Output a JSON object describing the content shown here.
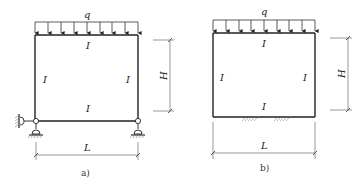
{
  "figures": [
    {
      "id": "a",
      "caption": "a)",
      "load_label": "q",
      "top_beam_label": "I",
      "left_column_label": "I",
      "right_column_label": "I",
      "bottom_beam_label": "I",
      "height_label": "H",
      "length_label": "L",
      "supports": "left lateral roller + two vertical roller supports at bottom corners"
    },
    {
      "id": "b",
      "caption": "b)",
      "load_label": "q",
      "top_beam_label": "I",
      "left_column_label": "I",
      "right_column_label": "I",
      "bottom_beam_label": "I",
      "height_label": "H",
      "length_label": "L",
      "supports": "bottom beam resting on ground (hatched)"
    }
  ],
  "colors": {
    "line": "#222222",
    "dim_line": "#555555",
    "hatch": "#777777"
  }
}
